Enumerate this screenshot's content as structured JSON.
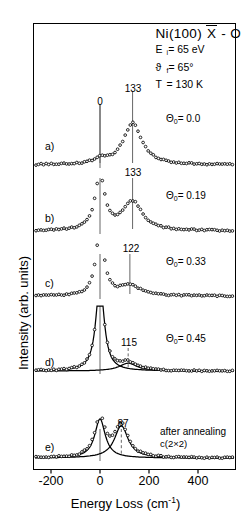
{
  "figure": {
    "title_prefix": "Ni(100) ",
    "title_sym": "X",
    "title_suffix": " - O",
    "params": [
      {
        "sym": "E",
        "sub": "i",
        "eq": "= 65 eV"
      },
      {
        "sym": "ϑ",
        "sub": "f",
        "eq": "= 65°"
      },
      {
        "sym": "T",
        "sub": "",
        "eq": "= 130 K"
      }
    ],
    "annotation_line1": "after annealing",
    "annotation_line2": "c(2×2)"
  },
  "axes": {
    "xlabel_text": "Energy Loss (cm",
    "xlabel_sup": "-1",
    "xlabel_close": ")",
    "ylabel": "Intensity (arb. units)",
    "xticks": [
      -200,
      0,
      200,
      400
    ],
    "xtick_labels": [
      "-200",
      "0",
      "200",
      "400"
    ],
    "xlim": [
      -290,
      470
    ]
  },
  "chart_data": {
    "type": "line",
    "xlabel": "Energy Loss (cm-1)",
    "ylabel": "Intensity (arb. units)",
    "xlim": [
      -290,
      470
    ],
    "grid": false,
    "legend": "none",
    "series": [
      {
        "name": "a",
        "label": "a)",
        "coverage_label": "Θ",
        "coverage_sub": "0",
        "coverage_value": "= 0.0",
        "peak_labels": [
          "0",
          "133"
        ],
        "peaks": [
          {
            "position": 0,
            "label": "0",
            "relative_height": 0.12,
            "width": 28
          },
          {
            "position": 133,
            "label": "133",
            "relative_height": 1.0,
            "width": 46
          }
        ]
      },
      {
        "name": "b",
        "label": "b)",
        "coverage_label": "Θ",
        "coverage_sub": "0",
        "coverage_value": "= 0.19",
        "peak_labels": [
          "133"
        ],
        "peaks": [
          {
            "position": 0,
            "label": "0",
            "relative_height": 1.6,
            "width": 24
          },
          {
            "position": 133,
            "label": "133",
            "relative_height": 0.85,
            "width": 48
          }
        ]
      },
      {
        "name": "c",
        "label": "c)",
        "coverage_label": "Θ",
        "coverage_sub": "0",
        "coverage_value": "= 0.33",
        "peak_labels": [
          "122"
        ],
        "peaks": [
          {
            "position": 0,
            "label": "0",
            "relative_height": 2.2,
            "width": 20
          },
          {
            "position": 122,
            "label": "122",
            "relative_height": 0.33,
            "width": 52
          }
        ]
      },
      {
        "name": "d",
        "label": "d)",
        "coverage_label": "Θ",
        "coverage_sub": "0",
        "coverage_value": "= 0.45",
        "peak_labels": [
          "115"
        ],
        "fitted": true,
        "peaks": [
          {
            "position": 0,
            "label": "0",
            "relative_height": 3.0,
            "width": 20
          },
          {
            "position": 115,
            "label": "115",
            "relative_height": 0.26,
            "width": 44
          }
        ]
      },
      {
        "name": "e",
        "label": "e)",
        "coverage_label": "",
        "coverage_sub": "",
        "coverage_value": "",
        "peak_labels": [
          "87"
        ],
        "fitted": true,
        "peaks": [
          {
            "position": 0,
            "label": "0",
            "relative_height": 1.15,
            "width": 26
          },
          {
            "position": 87,
            "label": "87",
            "relative_height": 0.95,
            "width": 34
          }
        ]
      }
    ]
  }
}
